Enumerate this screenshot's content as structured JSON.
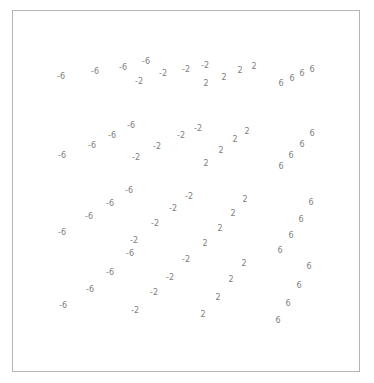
{
  "figure": {
    "type": "contour-plot",
    "title": "",
    "background_color": "#ffffff",
    "frame": {
      "border_color": "#b4b4b4",
      "x": 12,
      "y": 10,
      "width": 348,
      "height": 362
    },
    "label_color": "#808080",
    "label_font_size": 8
  },
  "chart_data": {
    "type": "scatter",
    "title": "",
    "subtitle": "",
    "xlabel": "",
    "ylabel": "",
    "xlim": [
      12,
      360
    ],
    "ylim": [
      372,
      10
    ],
    "grid": false,
    "legend": "none",
    "contour_levels": [
      -6,
      -2,
      2,
      6
    ],
    "labels": [
      {
        "text": "-6",
        "x": 61,
        "y": 76
      },
      {
        "text": "-6",
        "x": 95,
        "y": 71
      },
      {
        "text": "-6",
        "x": 123,
        "y": 67
      },
      {
        "text": "-6",
        "x": 146,
        "y": 61
      },
      {
        "text": "-2",
        "x": 139,
        "y": 81
      },
      {
        "text": "-2",
        "x": 163,
        "y": 73
      },
      {
        "text": "-2",
        "x": 186,
        "y": 69
      },
      {
        "text": "-2",
        "x": 205,
        "y": 65
      },
      {
        "text": "2",
        "x": 206,
        "y": 83
      },
      {
        "text": "2",
        "x": 224,
        "y": 77
      },
      {
        "text": "2",
        "x": 240,
        "y": 70
      },
      {
        "text": "2",
        "x": 254,
        "y": 66
      },
      {
        "text": "6",
        "x": 281,
        "y": 83
      },
      {
        "text": "6",
        "x": 292,
        "y": 78
      },
      {
        "text": "6",
        "x": 302,
        "y": 73
      },
      {
        "text": "6",
        "x": 312,
        "y": 69
      },
      {
        "text": "-6",
        "x": 62,
        "y": 155
      },
      {
        "text": "-6",
        "x": 92,
        "y": 145
      },
      {
        "text": "-6",
        "x": 112,
        "y": 135
      },
      {
        "text": "-6",
        "x": 131,
        "y": 125
      },
      {
        "text": "-2",
        "x": 136,
        "y": 157
      },
      {
        "text": "-2",
        "x": 157,
        "y": 146
      },
      {
        "text": "-2",
        "x": 181,
        "y": 135
      },
      {
        "text": "-2",
        "x": 198,
        "y": 128
      },
      {
        "text": "2",
        "x": 206,
        "y": 163
      },
      {
        "text": "2",
        "x": 221,
        "y": 150
      },
      {
        "text": "2",
        "x": 235,
        "y": 139
      },
      {
        "text": "2",
        "x": 247,
        "y": 131
      },
      {
        "text": "6",
        "x": 281,
        "y": 166
      },
      {
        "text": "6",
        "x": 291,
        "y": 155
      },
      {
        "text": "6",
        "x": 302,
        "y": 144
      },
      {
        "text": "6",
        "x": 312,
        "y": 133
      },
      {
        "text": "-6",
        "x": 62,
        "y": 232
      },
      {
        "text": "-6",
        "x": 89,
        "y": 216
      },
      {
        "text": "-6",
        "x": 110,
        "y": 203
      },
      {
        "text": "-6",
        "x": 129,
        "y": 190
      },
      {
        "text": "-2",
        "x": 134,
        "y": 240
      },
      {
        "text": "-2",
        "x": 155,
        "y": 223
      },
      {
        "text": "-2",
        "x": 173,
        "y": 208
      },
      {
        "text": "-2",
        "x": 189,
        "y": 196
      },
      {
        "text": "2",
        "x": 205,
        "y": 243
      },
      {
        "text": "2",
        "x": 220,
        "y": 228
      },
      {
        "text": "2",
        "x": 233,
        "y": 213
      },
      {
        "text": "2",
        "x": 245,
        "y": 199
      },
      {
        "text": "6",
        "x": 280,
        "y": 250
      },
      {
        "text": "6",
        "x": 291,
        "y": 235
      },
      {
        "text": "6",
        "x": 301,
        "y": 219
      },
      {
        "text": "6",
        "x": 311,
        "y": 202
      },
      {
        "text": "-6",
        "x": 63,
        "y": 305
      },
      {
        "text": "-6",
        "x": 90,
        "y": 289
      },
      {
        "text": "-6",
        "x": 110,
        "y": 272
      },
      {
        "text": "-6",
        "x": 130,
        "y": 253
      },
      {
        "text": "-2",
        "x": 135,
        "y": 310
      },
      {
        "text": "-2",
        "x": 154,
        "y": 292
      },
      {
        "text": "-2",
        "x": 170,
        "y": 277
      },
      {
        "text": "-2",
        "x": 186,
        "y": 259
      },
      {
        "text": "2",
        "x": 203,
        "y": 314
      },
      {
        "text": "2",
        "x": 218,
        "y": 297
      },
      {
        "text": "2",
        "x": 231,
        "y": 279
      },
      {
        "text": "2",
        "x": 244,
        "y": 263
      },
      {
        "text": "6",
        "x": 278,
        "y": 320
      },
      {
        "text": "6",
        "x": 288,
        "y": 303
      },
      {
        "text": "6",
        "x": 299,
        "y": 285
      },
      {
        "text": "6",
        "x": 309,
        "y": 266
      }
    ]
  }
}
